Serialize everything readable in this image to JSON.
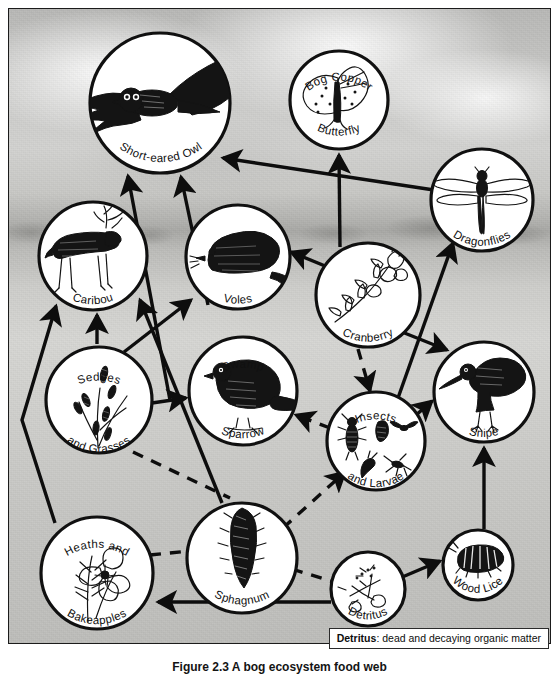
{
  "figure": {
    "caption": "Figure 2.3  A bog ecosystem food web",
    "definition": {
      "term": "Detritus",
      "separator": ": ",
      "text": "dead and decaying organic matter"
    }
  },
  "diagram": {
    "type": "food-web",
    "title": "Bog ecosystem food web",
    "background": "marsh photograph (grayscale)",
    "nodes": [
      {
        "id": "owl",
        "label_top": "",
        "label_bottom": "Short-eared Owl",
        "art": "owl-in-flight",
        "cx": 160,
        "cy": 103,
        "r": 72
      },
      {
        "id": "butterfly",
        "label_top": "Bog  Copper",
        "label_bottom": "Butterfly",
        "art": "butterfly",
        "cx": 339,
        "cy": 100,
        "r": 51
      },
      {
        "id": "dragonfly",
        "label_top": "",
        "label_bottom": "Dragonflies",
        "art": "dragonfly",
        "cx": 482,
        "cy": 200,
        "r": 53
      },
      {
        "id": "caribou",
        "label_top": "",
        "label_bottom": "Caribou",
        "art": "caribou",
        "cx": 93,
        "cy": 256,
        "r": 56
      },
      {
        "id": "voles",
        "label_top": "",
        "label_bottom": "Voles",
        "art": "vole",
        "cx": 238,
        "cy": 257,
        "r": 54
      },
      {
        "id": "cranberry",
        "label_top": "",
        "label_bottom": "Cranberry",
        "art": "cranberry-sprig",
        "cx": 368,
        "cy": 295,
        "r": 54
      },
      {
        "id": "sedges",
        "label_top": "Sedges",
        "label_bottom": "and Grasses",
        "art": "sedge-grass",
        "cx": 99,
        "cy": 400,
        "r": 55
      },
      {
        "id": "sparrow",
        "label_top": "Swamp",
        "label_bottom": "Sparrow",
        "art": "sparrow",
        "cx": 243,
        "cy": 391,
        "r": 56
      },
      {
        "id": "insects",
        "label_top": "Insects",
        "label_bottom": "and Larvae",
        "art": "insects-larvae",
        "cx": 376,
        "cy": 441,
        "r": 51
      },
      {
        "id": "snipe",
        "label_top": "",
        "label_bottom": "Snipe",
        "art": "snipe",
        "cx": 484,
        "cy": 392,
        "r": 52
      },
      {
        "id": "heaths",
        "label_top": "Heaths  and",
        "label_bottom": "Bakeapples",
        "art": "heath-bakeapple",
        "cx": 97,
        "cy": 573,
        "r": 58
      },
      {
        "id": "sphagnum",
        "label_top": "",
        "label_bottom": "Sphagnum",
        "art": "sphagnum-moss",
        "cx": 242,
        "cy": 558,
        "r": 57
      },
      {
        "id": "detritus",
        "label_top": "",
        "label_bottom": "Detritus",
        "art": "detritus-twigs",
        "cx": 368,
        "cy": 589,
        "r": 39
      },
      {
        "id": "woodlice",
        "label_top": "",
        "label_bottom": "Wood Lice",
        "art": "wood-louse",
        "cx": 478,
        "cy": 565,
        "r": 37
      }
    ],
    "links": [
      {
        "from": "caribou",
        "to": "owl",
        "style": "solid",
        "note": "caribou to short-eared owl"
      },
      {
        "from": "voles",
        "to": "owl",
        "style": "solid",
        "note": "voles to short-eared owl"
      },
      {
        "from": "dragonfly",
        "to": "owl",
        "style": "solid",
        "note": "dragonflies to short-eared owl"
      },
      {
        "from": "cranberry",
        "to": "butterfly",
        "style": "solid",
        "note": "cranberry to bog copper butterfly"
      },
      {
        "from": "insects",
        "to": "dragonfly",
        "style": "solid",
        "note": "insects and larvae to dragonflies"
      },
      {
        "from": "cranberry",
        "to": "voles",
        "style": "solid",
        "note": "cranberry to voles"
      },
      {
        "from": "sedges",
        "to": "caribou",
        "style": "solid",
        "note": "sedges and grasses to caribou"
      },
      {
        "from": "heaths",
        "to": "caribou",
        "style": "solid",
        "note": "heaths and bakeapples to caribou"
      },
      {
        "from": "sphagnum",
        "to": "caribou",
        "style": "solid",
        "note": "sphagnum to caribou"
      },
      {
        "from": "sedges",
        "to": "voles",
        "style": "solid",
        "note": "sedges and grasses to voles"
      },
      {
        "from": "sedges",
        "to": "sparrow",
        "style": "solid",
        "note": "sedges and grasses to swamp sparrow"
      },
      {
        "from": "insects",
        "to": "sparrow",
        "style": "dashed",
        "note": "insects and larvae to swamp sparrow"
      },
      {
        "from": "cranberry",
        "to": "insects",
        "style": "dashed",
        "note": "cranberry to insects and larvae"
      },
      {
        "from": "sphagnum",
        "to": "insects",
        "style": "dashed",
        "note": "sphagnum to insects and larvae"
      },
      {
        "from": "insects",
        "to": "snipe",
        "style": "solid",
        "note": "insects and larvae to snipe"
      },
      {
        "from": "cranberry",
        "to": "snipe",
        "style": "solid",
        "note": "cranberry to snipe"
      },
      {
        "from": "woodlice",
        "to": "snipe",
        "style": "solid",
        "note": "wood lice to snipe"
      },
      {
        "from": "detritus",
        "to": "woodlice",
        "style": "solid",
        "note": "detritus to wood lice"
      },
      {
        "from": "detritus",
        "to": "heaths",
        "style": "solid",
        "note": "detritus to heaths and bakeapples"
      },
      {
        "from": "sphagnum",
        "to": "detritus",
        "style": "dashed",
        "note": "sphagnum to detritus"
      },
      {
        "from": "heaths",
        "to": "sphagnum",
        "style": "dashed",
        "note": "heaths and bakeapples to sphagnum"
      }
    ]
  }
}
